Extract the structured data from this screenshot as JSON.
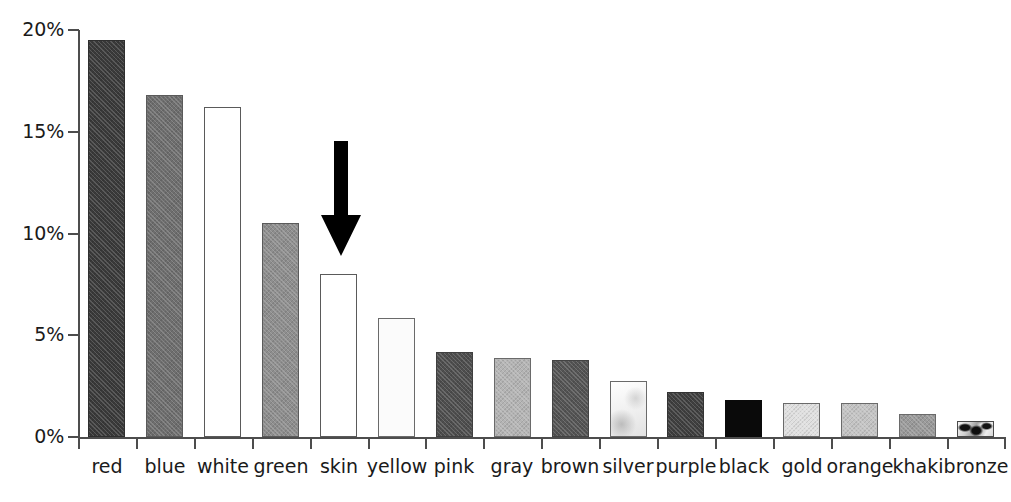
{
  "chart_data": {
    "type": "bar",
    "title": "",
    "subtitle": "",
    "xlabel": "",
    "ylabel": "",
    "ylim": [
      0,
      20
    ],
    "grid": false,
    "legend": "none",
    "y_tick_labels": [
      "20%",
      "15%",
      "10%",
      "5%",
      "0%"
    ],
    "y_tick_values": [
      20,
      15,
      10,
      5,
      0
    ],
    "categories": [
      "red",
      "blue",
      "white",
      "green",
      "skin",
      "yellow",
      "pink",
      "gray",
      "brown",
      "silver",
      "purple",
      "black",
      "gold",
      "orange",
      "khaki",
      "bronze"
    ],
    "values": [
      19.5,
      16.8,
      16.2,
      10.5,
      8.0,
      5.85,
      4.2,
      3.9,
      3.8,
      2.75,
      2.2,
      1.8,
      1.65,
      1.65,
      1.15,
      0.8
    ],
    "value_unit": "%",
    "bars": [
      {
        "label": "red",
        "value": 19.5,
        "fill": "#3a3a3a",
        "border": "#2e2e2e",
        "texture": "hatch"
      },
      {
        "label": "blue",
        "value": 16.8,
        "fill": "#6e6e6e",
        "border": "#5a5a5a",
        "texture": "hatch"
      },
      {
        "label": "white",
        "value": 16.2,
        "fill": "#ffffff",
        "border": "#5a5a5a",
        "texture": "none"
      },
      {
        "label": "green",
        "value": 10.5,
        "fill": "#8e8e8e",
        "border": "#5a5a5a",
        "texture": "hatch"
      },
      {
        "label": "skin",
        "value": 8.0,
        "fill": "#ffffff",
        "border": "#5a5a5a",
        "texture": "none"
      },
      {
        "label": "yellow",
        "value": 5.85,
        "fill": "#fbfbfb",
        "border": "#6a6a6a",
        "texture": "none"
      },
      {
        "label": "pink",
        "value": 4.2,
        "fill": "#4e4e4e",
        "border": "#3f3f3f",
        "texture": "hatch"
      },
      {
        "label": "gray",
        "value": 3.9,
        "fill": "#b4b4b4",
        "border": "#6a6a6a",
        "texture": "hatch"
      },
      {
        "label": "brown",
        "value": 3.8,
        "fill": "#545454",
        "border": "#434343",
        "texture": "hatch"
      },
      {
        "label": "silver",
        "value": 2.75,
        "fill": "#f4f4f4",
        "border": "#6a6a6a",
        "texture": "silver"
      },
      {
        "label": "purple",
        "value": 2.2,
        "fill": "#3f3f3f",
        "border": "#333333",
        "texture": "hatch"
      },
      {
        "label": "black",
        "value": 1.8,
        "fill": "#0a0a0a",
        "border": "#0a0a0a",
        "texture": "none"
      },
      {
        "label": "gold",
        "value": 1.65,
        "fill": "#e0e0e0",
        "border": "#6a6a6a",
        "texture": "hatch"
      },
      {
        "label": "orange",
        "value": 1.65,
        "fill": "#c4c4c4",
        "border": "#6a6a6a",
        "texture": "hatch"
      },
      {
        "label": "khaki",
        "value": 1.15,
        "fill": "#9a9a9a",
        "border": "#6a6a6a",
        "texture": "hatch"
      },
      {
        "label": "bronze",
        "value": 0.8,
        "fill": "#8f8f8f",
        "border": "#4a4a4a",
        "texture": "bronze"
      }
    ],
    "annotations": [
      {
        "type": "arrow",
        "name": "skin-highlight-arrow",
        "direction": "down",
        "points_at": "skin",
        "color": "#000000"
      }
    ]
  },
  "colors": {
    "axis": "#4d4d4d",
    "text": "#1a1a1a",
    "background": "#ffffff",
    "annotation": "#000000"
  }
}
